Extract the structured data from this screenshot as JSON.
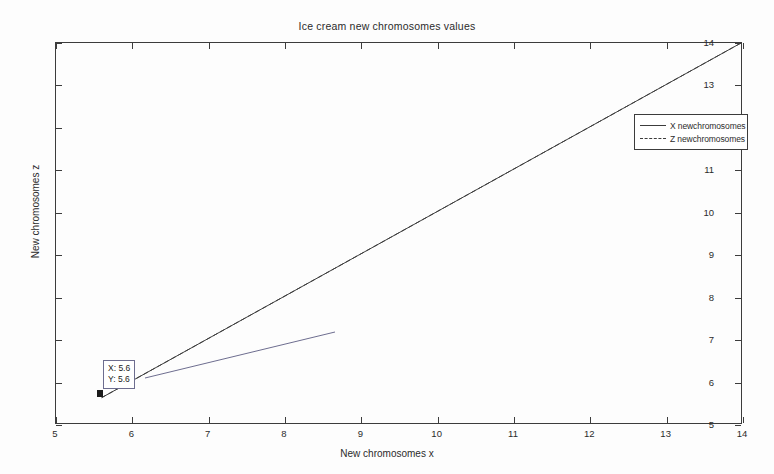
{
  "chart_data": {
    "type": "line",
    "title": "Ice cream new chromosomes values",
    "xlabel": "New chromosomes x",
    "ylabel": "New chromosomes z",
    "xlim": [
      5,
      14
    ],
    "ylim": [
      5,
      14
    ],
    "xticks": [
      5,
      6,
      7,
      8,
      9,
      10,
      11,
      12,
      13,
      14
    ],
    "yticks": [
      5,
      6,
      7,
      8,
      9,
      10,
      11,
      12,
      13,
      14
    ],
    "xtick_labels": [
      "5",
      "6",
      "7",
      "8",
      "9",
      "10",
      "11",
      "12",
      "13",
      "14"
    ],
    "ytick_labels": [
      "5",
      "6",
      "7",
      "8",
      "9",
      "10",
      "11",
      "12",
      "13",
      "14"
    ],
    "grid": false,
    "legend_position": "upper right",
    "series": [
      {
        "name": "X newchromosomes",
        "style": "solid",
        "color": "#3c3c3c",
        "x": [
          5.6,
          14
        ],
        "y": [
          5.6,
          14
        ]
      },
      {
        "name": "Z newchromosomes",
        "style": "dashed",
        "color": "#3c3c3c",
        "x": [
          5.6,
          14
        ],
        "y": [
          5.6,
          14
        ]
      }
    ],
    "annotations": [
      {
        "type": "data-cursor",
        "x": 5.6,
        "y": 5.6,
        "lines": [
          "X: 5.6",
          "Y: 5.6"
        ]
      }
    ]
  },
  "legend": {
    "entries": [
      {
        "label": "X newchromosomes"
      },
      {
        "label": "Z newchromosomes"
      }
    ]
  },
  "datatip": {
    "x_line": "X: 5.6",
    "y_line": "Y: 5.6"
  },
  "axes": {
    "x_label": "New chromosomes x",
    "y_label": "New chromosomes z",
    "x_ticks": [
      "5",
      "6",
      "7",
      "8",
      "9",
      "10",
      "11",
      "12",
      "13",
      "14"
    ],
    "y_ticks": [
      "5",
      "6",
      "7",
      "8",
      "9",
      "10",
      "11",
      "12",
      "13",
      "14"
    ]
  },
  "title": "Ice cream new chromosomes values"
}
